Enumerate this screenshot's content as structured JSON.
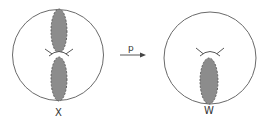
{
  "diagram": {
    "left_figure": {
      "label": "X",
      "circle": {
        "cx": 58,
        "cy": 55,
        "r": 45.5
      },
      "lobes": [
        {
          "name": "upper-lobe",
          "cx": 59,
          "cy": 31,
          "rx": 8,
          "ry": 22
        },
        {
          "name": "lower-lobe",
          "cx": 59,
          "cy": 79,
          "rx": 8,
          "ry": 22
        }
      ],
      "cusp": {
        "cx": 59,
        "cy": 54
      }
    },
    "arrow": {
      "label": "p",
      "x1": 120,
      "x2": 146,
      "y": 55
    },
    "right_figure": {
      "label": "W",
      "circle": {
        "cx": 210,
        "cy": 58,
        "r": 46
      },
      "lobes": [
        {
          "name": "single-lobe",
          "cx": 209,
          "cy": 81,
          "rx": 9,
          "ry": 23
        }
      ],
      "cusp": {
        "cx": 210,
        "cy": 53
      }
    },
    "colors": {
      "stroke": "#6a6a6a",
      "lobe_fill": "#8c8c8c",
      "lobe_stroke": "#555555",
      "text": "#333333"
    }
  }
}
